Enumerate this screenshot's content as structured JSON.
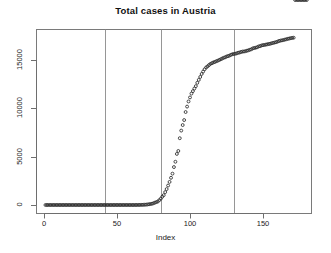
{
  "chart_data": {
    "type": "scatter",
    "title": "Total cases in Austria",
    "xlabel": "Index",
    "ylabel": "",
    "marker": "open-circle",
    "marker_color": "#2b2b2b",
    "grid": false,
    "legend": null,
    "xlim": [
      0,
      184
    ],
    "ylim": [
      0,
      18500
    ],
    "xticks": [
      0,
      50,
      100,
      150
    ],
    "xtick_labels": [
      "0",
      "50",
      "100",
      "150"
    ],
    "yticks": [
      0,
      5000,
      10000,
      15000
    ],
    "ytick_labels": [
      "0",
      "5000",
      "10000",
      "15000"
    ],
    "annotations": [
      {
        "type": "vline",
        "x": 42,
        "color": "#8a8a8a"
      },
      {
        "type": "vline",
        "x": 80,
        "color": "#8a8a8a"
      },
      {
        "type": "vline",
        "x": 130,
        "color": "#8a8a8a"
      }
    ],
    "x": [
      1,
      2,
      3,
      4,
      5,
      6,
      7,
      8,
      9,
      10,
      11,
      12,
      13,
      14,
      15,
      16,
      17,
      18,
      19,
      20,
      21,
      22,
      23,
      24,
      25,
      26,
      27,
      28,
      29,
      30,
      31,
      32,
      33,
      34,
      35,
      36,
      37,
      38,
      39,
      40,
      41,
      42,
      43,
      44,
      45,
      46,
      47,
      48,
      49,
      50,
      51,
      52,
      53,
      54,
      55,
      56,
      57,
      58,
      59,
      60,
      61,
      62,
      63,
      64,
      65,
      66,
      67,
      68,
      69,
      70,
      71,
      72,
      73,
      74,
      75,
      76,
      77,
      78,
      79,
      80,
      81,
      82,
      83,
      84,
      85,
      86,
      87,
      88,
      89,
      90,
      91,
      92,
      93,
      94,
      95,
      96,
      97,
      98,
      99,
      100,
      101,
      102,
      103,
      104,
      105,
      106,
      107,
      108,
      109,
      110,
      111,
      112,
      113,
      114,
      115,
      116,
      117,
      118,
      119,
      120,
      121,
      122,
      123,
      124,
      125,
      126,
      127,
      128,
      129,
      130,
      131,
      132,
      133,
      134,
      135,
      136,
      137,
      138,
      139,
      140,
      141,
      142,
      143,
      144,
      145,
      146,
      147,
      148,
      149,
      150,
      151,
      152,
      153,
      154,
      155,
      156,
      157,
      158,
      159,
      160,
      161,
      162,
      163,
      164,
      165,
      166,
      167,
      168,
      169,
      170,
      171,
      172,
      173,
      174,
      175,
      176,
      177,
      178,
      179,
      180
    ],
    "y": [
      0,
      0,
      0,
      0,
      0,
      0,
      0,
      0,
      0,
      0,
      0,
      0,
      0,
      0,
      0,
      0,
      0,
      0,
      0,
      0,
      0,
      0,
      0,
      0,
      0,
      0,
      0,
      0,
      0,
      0,
      0,
      0,
      0,
      0,
      0,
      0,
      0,
      0,
      0,
      0,
      0,
      0,
      0,
      0,
      0,
      0,
      0,
      0,
      0,
      0,
      0,
      0,
      0,
      0,
      0,
      0,
      0,
      0,
      0,
      0,
      0,
      0,
      2,
      3,
      5,
      9,
      14,
      21,
      29,
      41,
      55,
      79,
      104,
      131,
      182,
      246,
      302,
      361,
      504,
      655,
      860,
      1018,
      1332,
      1646,
      2013,
      2388,
      2814,
      3244,
      3924,
      4474,
      5283,
      5588,
      6909,
      7697,
      8271,
      8788,
      9618,
      10180,
      10711,
      11129,
      11524,
      11781,
      12051,
      12297,
      12639,
      12942,
      13244,
      13555,
      13806,
      14041,
      14226,
      14336,
      14476,
      14595,
      14671,
      14749,
      14795,
      14873,
      14925,
      15002,
      15071,
      15148,
      15225,
      15274,
      15357,
      15402,
      15452,
      15531,
      15597,
      15621,
      15650,
      15684,
      15752,
      15774,
      15833,
      15871,
      15882,
      15911,
      15961,
      16002,
      16058,
      16109,
      16201,
      16242,
      16269,
      16321,
      16404,
      16436,
      16503,
      16539,
      16557,
      16591,
      16628,
      16655,
      16685,
      16733,
      16771,
      16808,
      16848,
      16902,
      16968,
      17005,
      17034,
      17064,
      17109,
      17148,
      17189,
      17223,
      17258,
      17285,
      17303
    ]
  },
  "plot": {
    "title": "Total cases in Austria",
    "xaxis_label": "Index"
  }
}
